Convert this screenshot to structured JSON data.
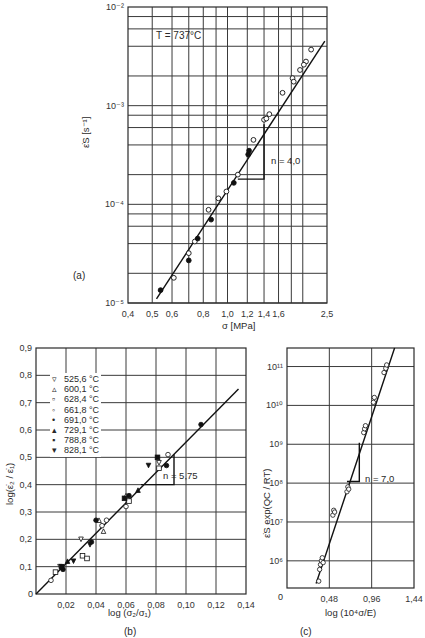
{
  "chart_data": [
    {
      "id": "a",
      "type": "scatter",
      "panel_label": "(a)",
      "annotation_temp": "T = 737°C",
      "slope_label": "n = 4,0",
      "xlabel": "σ [MPa]",
      "ylabel": "ε̇S [s⁻¹]",
      "xscale": "log",
      "yscale": "log",
      "xlim": [
        0.4,
        2.5
      ],
      "ylim": [
        1e-05,
        0.01
      ],
      "x_ticks": [
        "0,4",
        "0,5",
        "0,6",
        "0,8",
        "1,0",
        "1,2",
        "1,4",
        "1,6",
        "2,5"
      ],
      "y_ticks": [
        "10⁻⁵",
        "10⁻⁴",
        "10⁻³",
        "10⁻²"
      ],
      "fit_line": {
        "x": [
          0.52,
          2.45
        ],
        "y": [
          1.1e-05,
          0.0045
        ]
      },
      "series": [
        {
          "name": "open",
          "marker": "circle-open",
          "x": [
            0.61,
            0.7,
            0.74,
            0.84,
            0.92,
            0.99,
            1.1,
            1.27,
            1.4,
            1.43,
            1.47,
            1.66,
            1.82,
            1.95,
            2.06,
            2.16,
            1.84,
            2.02
          ],
          "y": [
            1.8e-05,
            3.2e-05,
            4.2e-05,
            8.8e-05,
            0.000115,
            0.000135,
            0.0002,
            0.00045,
            0.00072,
            0.00074,
            0.00082,
            0.00135,
            0.0019,
            0.0023,
            0.0028,
            0.0037,
            0.00175,
            0.0026
          ]
        },
        {
          "name": "filled",
          "marker": "circle-filled",
          "x": [
            0.54,
            0.7,
            0.76,
            0.86,
            1.06,
            1.21,
            1.22
          ],
          "y": [
            1.35e-05,
            2.7e-05,
            4.5e-05,
            7e-05,
            0.000165,
            0.00032,
            0.00035
          ]
        }
      ]
    },
    {
      "id": "b",
      "type": "scatter",
      "panel_label": "(b)",
      "slope_label": "n = 5,75",
      "xlabel": "log (σ₂/σ₁)",
      "ylabel": "log(ε̇₂ / ε̇₁)",
      "xlim": [
        0,
        0.14
      ],
      "ylim": [
        0,
        0.9
      ],
      "x_ticks": [
        "0,02",
        "0,04",
        "0,06",
        "0,08",
        "0,10",
        "0,12",
        "0,14"
      ],
      "y_ticks": [
        "0",
        "0,1",
        "0,2",
        "0,3",
        "0,4",
        "0,5",
        "0,6",
        "0,7",
        "0,8",
        "0,9"
      ],
      "origin_label": "0",
      "fit_line": {
        "x": [
          0,
          0.135
        ],
        "y": [
          0,
          0.75
        ]
      },
      "legend": [
        {
          "marker": "▿",
          "label": "525,6 °C"
        },
        {
          "marker": "▵",
          "label": "600,1 °C"
        },
        {
          "marker": "▫",
          "label": "628,4 °C"
        },
        {
          "marker": "◦",
          "label": "661,8 °C"
        },
        {
          "marker": "•",
          "label": "691,0 °C"
        },
        {
          "marker": "▴",
          "label": "729,1 °C"
        },
        {
          "marker": "▪",
          "label": "788,8 °C"
        },
        {
          "marker": "▾",
          "label": "828,1 °C"
        }
      ],
      "series": [
        {
          "name": "525,6 °C",
          "x": [
            0.016,
            0.03,
            0.082
          ],
          "y": [
            0.1,
            0.2,
            0.48
          ]
        },
        {
          "name": "600,1 °C",
          "x": [
            0.042,
            0.045,
            0.06
          ],
          "y": [
            0.27,
            0.23,
            0.36
          ]
        },
        {
          "name": "628,4 °C",
          "x": [
            0.013,
            0.031,
            0.034,
            0.062,
            0.082
          ],
          "y": [
            0.08,
            0.14,
            0.13,
            0.34,
            0.46
          ]
        },
        {
          "name": "661,8 °C",
          "x": [
            0.01,
            0.044,
            0.047,
            0.06,
            0.088
          ],
          "y": [
            0.05,
            0.25,
            0.27,
            0.32,
            0.51
          ]
        },
        {
          "name": "691,0 °C",
          "x": [
            0.018,
            0.037,
            0.04,
            0.062,
            0.087,
            0.11
          ],
          "y": [
            0.09,
            0.19,
            0.27,
            0.36,
            0.47,
            0.62
          ]
        },
        {
          "name": "729,1 °C",
          "x": [
            0.021,
            0.068
          ],
          "y": [
            0.12,
            0.38
          ]
        },
        {
          "name": "788,8 °C",
          "x": [
            0.017,
            0.059,
            0.081
          ],
          "y": [
            0.1,
            0.35,
            0.5
          ]
        },
        {
          "name": "828,1 °C",
          "x": [
            0.025,
            0.036,
            0.075
          ],
          "y": [
            0.12,
            0.18,
            0.47
          ]
        }
      ]
    },
    {
      "id": "c",
      "type": "scatter",
      "panel_label": "(c)",
      "slope_label": "n = 7,0",
      "xlabel": "log (10⁴σ/E)",
      "ylabel": "ε̇S exp(QC / RT)",
      "yscale": "log",
      "xlim": [
        0,
        1.44
      ],
      "ylim": [
        200000.0,
        300000000000.0
      ],
      "x_ticks": [
        "0,48",
        "0,96",
        "1,44"
      ],
      "origin_label": "0",
      "y_ticks": [
        "10⁶",
        "10⁷",
        "10⁸",
        "10⁹",
        "10¹⁰",
        "10¹¹"
      ],
      "fit_line": {
        "x": [
          0.33,
          1.22
        ],
        "y": [
          260000.0,
          300000000000.0
        ]
      },
      "series": [
        {
          "name": "data",
          "marker": "circle-open",
          "x": [
            0.36,
            0.37,
            0.38,
            0.39,
            0.4,
            0.41,
            0.52,
            0.53,
            0.54,
            0.68,
            0.69,
            0.7,
            0.87,
            0.88,
            0.89,
            0.98,
            0.99,
            1.1,
            1.12,
            1.13
          ],
          "y": [
            300000.0,
            600000.0,
            800000.0,
            1000000.0,
            1200000.0,
            900000.0,
            15000000.0,
            20000000.0,
            18000000.0,
            60000000.0,
            80000000.0,
            70000000.0,
            2000000000.0,
            2500000000.0,
            3000000000.0,
            12000000000.0,
            16000000000.0,
            70000000000.0,
            90000000000.0,
            110000000000.0
          ]
        }
      ]
    }
  ]
}
